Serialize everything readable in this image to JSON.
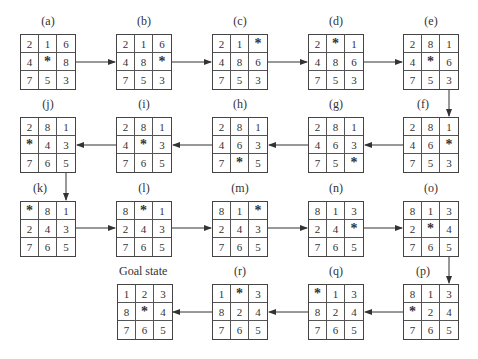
{
  "blank_symbol": "*",
  "states": [
    {
      "id": "a",
      "label": "(a)",
      "tiles": [
        "2",
        "1",
        "6",
        "4",
        "*",
        "8",
        "7",
        "5",
        "3"
      ]
    },
    {
      "id": "b",
      "label": "(b)",
      "tiles": [
        "2",
        "1",
        "6",
        "4",
        "8",
        "*",
        "7",
        "5",
        "3"
      ]
    },
    {
      "id": "c",
      "label": "(c)",
      "tiles": [
        "2",
        "1",
        "*",
        "4",
        "8",
        "6",
        "7",
        "5",
        "3"
      ]
    },
    {
      "id": "d",
      "label": "(d)",
      "tiles": [
        "2",
        "*",
        "1",
        "4",
        "8",
        "6",
        "7",
        "5",
        "3"
      ]
    },
    {
      "id": "e",
      "label": "(e)",
      "tiles": [
        "2",
        "8",
        "1",
        "4",
        "*",
        "6",
        "7",
        "5",
        "3"
      ]
    },
    {
      "id": "f",
      "label": "(f)",
      "tiles": [
        "2",
        "8",
        "1",
        "4",
        "6",
        "*",
        "7",
        "5",
        "3"
      ]
    },
    {
      "id": "g",
      "label": "(g)",
      "tiles": [
        "2",
        "8",
        "1",
        "4",
        "6",
        "3",
        "7",
        "5",
        "*"
      ]
    },
    {
      "id": "h",
      "label": "(h)",
      "tiles": [
        "2",
        "8",
        "1",
        "4",
        "6",
        "3",
        "7",
        "*",
        "5"
      ]
    },
    {
      "id": "i",
      "label": "(i)",
      "tiles": [
        "2",
        "8",
        "1",
        "4",
        "*",
        "3",
        "7",
        "6",
        "5"
      ]
    },
    {
      "id": "j",
      "label": "(j)",
      "tiles": [
        "2",
        "8",
        "1",
        "*",
        "4",
        "3",
        "7",
        "6",
        "5"
      ]
    },
    {
      "id": "k",
      "label": "(k)",
      "tiles": [
        "*",
        "8",
        "1",
        "2",
        "4",
        "3",
        "7",
        "6",
        "5"
      ]
    },
    {
      "id": "l",
      "label": "(l)",
      "tiles": [
        "8",
        "*",
        "1",
        "2",
        "4",
        "3",
        "7",
        "6",
        "5"
      ]
    },
    {
      "id": "m",
      "label": "(m)",
      "tiles": [
        "8",
        "1",
        "*",
        "2",
        "4",
        "3",
        "7",
        "6",
        "5"
      ]
    },
    {
      "id": "n",
      "label": "(n)",
      "tiles": [
        "8",
        "1",
        "3",
        "2",
        "4",
        "*",
        "7",
        "6",
        "5"
      ]
    },
    {
      "id": "o",
      "label": "(o)",
      "tiles": [
        "8",
        "1",
        "3",
        "2",
        "*",
        "4",
        "7",
        "6",
        "5"
      ]
    },
    {
      "id": "p",
      "label": "(p)",
      "tiles": [
        "8",
        "1",
        "3",
        "*",
        "2",
        "4",
        "7",
        "6",
        "5"
      ]
    },
    {
      "id": "q",
      "label": "(q)",
      "tiles": [
        "*",
        "1",
        "3",
        "8",
        "2",
        "4",
        "7",
        "6",
        "5"
      ]
    },
    {
      "id": "r",
      "label": "(r)",
      "tiles": [
        "1",
        "*",
        "3",
        "8",
        "2",
        "4",
        "7",
        "6",
        "5"
      ]
    },
    {
      "id": "goal",
      "label": "Goal state",
      "tiles": [
        "1",
        "2",
        "3",
        "8",
        "*",
        "4",
        "7",
        "6",
        "5"
      ]
    }
  ]
}
